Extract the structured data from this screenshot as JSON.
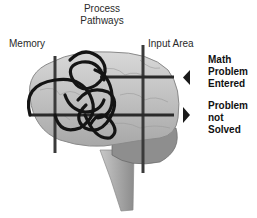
{
  "labels": {
    "process_line1": "Process",
    "process_line2": "Pathways",
    "memory": "Memory",
    "input_area": "Input Area",
    "math_line1": "Math",
    "math_line2": "Problem",
    "math_line3": "Entered",
    "notsolved_line1": "Problem",
    "notsolved_line2": "not",
    "notsolved_line3": "Solved"
  },
  "colors": {
    "brain": "#c9c9c9",
    "brain_dark": "#8a8a8a",
    "lines": "#3a3a3a",
    "tangle": "#141414"
  }
}
